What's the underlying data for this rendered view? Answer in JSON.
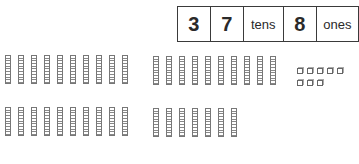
{
  "place_value_table": {
    "tens_digit": "3",
    "ones_digit_of_tens": "7",
    "tens_label": "tens",
    "ones_value": "8",
    "ones_label": "ones"
  },
  "base_ten_blocks": {
    "rod_groups": [
      {
        "position": "top-left",
        "rods": 10
      },
      {
        "position": "top-middle",
        "rods": 10
      },
      {
        "position": "bottom-left",
        "rods": 10
      },
      {
        "position": "bottom-middle",
        "rods": 7
      }
    ],
    "total_tens_rods": 37,
    "unit_cubes": 8,
    "unit_cube_rows": [
      5,
      3
    ]
  },
  "colors": {
    "border": "#3a3a3a",
    "block_stroke": "#777777",
    "background": "#ffffff"
  }
}
